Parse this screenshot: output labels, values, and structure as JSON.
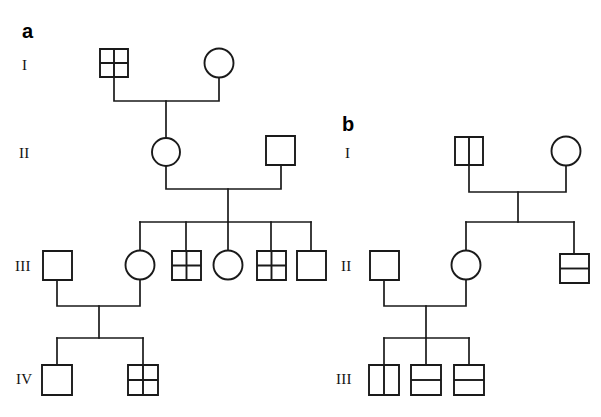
{
  "figure": {
    "type": "pedigree-chart",
    "background_color": "#ffffff",
    "line_color": "#1a1a1a",
    "symbol_fill": "#ffffff",
    "width": 601,
    "height": 417
  },
  "panels": [
    {
      "id": "panel-a",
      "letter": "a",
      "letter_x": 22,
      "letter_y": 38,
      "generation_labels": [
        {
          "text": "I",
          "x": 22,
          "y": 70
        },
        {
          "text": "II",
          "x": 19,
          "y": 158
        },
        {
          "text": "III",
          "x": 15,
          "y": 271
        },
        {
          "text": "IV",
          "x": 16,
          "y": 384
        }
      ],
      "individuals": [
        {
          "id": "a-I-1",
          "shape": "square",
          "pattern": "quartered",
          "cx": 114,
          "cy": 63,
          "size": 28,
          "generation": "I"
        },
        {
          "id": "a-I-2",
          "shape": "circle",
          "pattern": "empty",
          "cx": 219,
          "cy": 63,
          "size": 28,
          "generation": "I"
        },
        {
          "id": "a-II-1",
          "shape": "circle",
          "pattern": "empty",
          "cx": 166,
          "cy": 152,
          "size": 28,
          "generation": "II"
        },
        {
          "id": "a-II-2",
          "shape": "square",
          "pattern": "empty",
          "cx": 281,
          "cy": 151,
          "size": 29,
          "generation": "II"
        },
        {
          "id": "a-III-1",
          "shape": "square",
          "pattern": "empty",
          "cx": 57,
          "cy": 265,
          "size": 29,
          "generation": "III"
        },
        {
          "id": "a-III-2",
          "shape": "circle",
          "pattern": "empty",
          "cx": 140,
          "cy": 265,
          "size": 29,
          "generation": "III"
        },
        {
          "id": "a-III-3",
          "shape": "square",
          "pattern": "quartered",
          "cx": 186,
          "cy": 265,
          "size": 29,
          "generation": "III"
        },
        {
          "id": "a-III-4",
          "shape": "circle",
          "pattern": "empty",
          "cx": 228,
          "cy": 265,
          "size": 29,
          "generation": "III"
        },
        {
          "id": "a-III-5",
          "shape": "square",
          "pattern": "quartered",
          "cx": 271,
          "cy": 265,
          "size": 29,
          "generation": "III"
        },
        {
          "id": "a-III-6",
          "shape": "square",
          "pattern": "empty",
          "cx": 311,
          "cy": 265,
          "size": 29,
          "generation": "III"
        },
        {
          "id": "a-IV-1",
          "shape": "square",
          "pattern": "empty",
          "cx": 57,
          "cy": 380,
          "size": 30,
          "generation": "IV"
        },
        {
          "id": "a-IV-2",
          "shape": "square",
          "pattern": "quartered",
          "cx": 143,
          "cy": 380,
          "size": 30,
          "generation": "IV"
        }
      ],
      "matings": [
        {
          "id": "a-mating-1",
          "left": "a-I-1",
          "right": "a-I-2",
          "child_drop_x": 166
        },
        {
          "id": "a-mating-2",
          "left": "a-II-1",
          "right": "a-II-2",
          "child_drop_x": 228
        },
        {
          "id": "a-mating-3",
          "left": "a-III-1",
          "right": "a-III-2",
          "child_drop_x": 99
        }
      ]
    },
    {
      "id": "panel-b",
      "letter": "b",
      "letter_x": 342,
      "letter_y": 131,
      "generation_labels": [
        {
          "text": "I",
          "x": 344,
          "y": 158
        },
        {
          "text": "II",
          "x": 340,
          "y": 271
        },
        {
          "text": "III",
          "x": 336,
          "y": 384
        }
      ],
      "individuals": [
        {
          "id": "b-I-1",
          "shape": "square",
          "pattern": "vertical-split",
          "cx": 469,
          "cy": 151,
          "size": 28,
          "generation": "I"
        },
        {
          "id": "b-I-2",
          "shape": "circle",
          "pattern": "empty",
          "cx": 566,
          "cy": 151,
          "size": 28,
          "generation": "I"
        },
        {
          "id": "b-II-1",
          "shape": "square",
          "pattern": "empty",
          "cx": 384,
          "cy": 265,
          "size": 29,
          "generation": "II"
        },
        {
          "id": "b-II-2",
          "shape": "circle",
          "pattern": "empty",
          "cx": 466,
          "cy": 265,
          "size": 29,
          "generation": "II"
        },
        {
          "id": "b-II-3",
          "shape": "square",
          "pattern": "horizontal-split",
          "cx": 574,
          "cy": 268,
          "size": 29,
          "generation": "II"
        },
        {
          "id": "b-III-1",
          "shape": "square",
          "pattern": "vertical-split",
          "cx": 384,
          "cy": 380,
          "size": 30,
          "generation": "III"
        },
        {
          "id": "b-III-2",
          "shape": "square",
          "pattern": "horizontal-split",
          "cx": 426,
          "cy": 380,
          "size": 30,
          "generation": "III"
        },
        {
          "id": "b-III-3",
          "shape": "square",
          "pattern": "horizontal-split",
          "cx": 469,
          "cy": 380,
          "size": 30,
          "generation": "III"
        }
      ],
      "matings": [
        {
          "id": "b-mating-1",
          "left": "b-I-1",
          "right": "b-I-2",
          "child_drop_x": 518
        },
        {
          "id": "b-mating-2",
          "left": "b-II-1",
          "right": "b-II-2",
          "child_drop_x": 426
        }
      ]
    }
  ],
  "legend_notes": {
    "empty": "unaffected individual",
    "quartered": "square divided into four quadrants",
    "vertical-split": "square divided by one vertical line",
    "horizontal-split": "square divided by one horizontal line"
  }
}
